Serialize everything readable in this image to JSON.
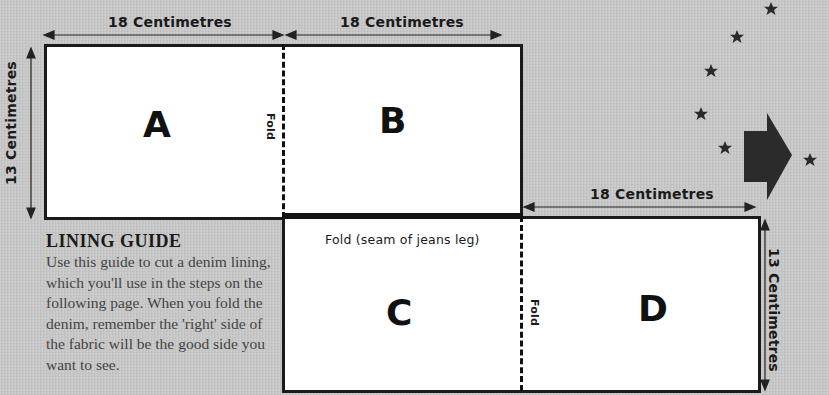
{
  "diagram": {
    "dimensions": {
      "top_left_width": "18 Centimetres",
      "top_right_width": "18 Centimetres",
      "left_height": "13 Centimetres",
      "bottom_right_width": "18 Centimetres",
      "right_height": "13 Centimetres"
    },
    "panels": [
      {
        "id": "A",
        "label": "A"
      },
      {
        "id": "B",
        "label": "B"
      },
      {
        "id": "C",
        "label": "C"
      },
      {
        "id": "D",
        "label": "D"
      }
    ],
    "fold_labels": {
      "top_fold": "Fold",
      "bottom_fold": "Fold",
      "seam_fold": "Fold (seam of jeans leg)"
    },
    "guide": {
      "title": "LINING GUIDE",
      "body": "Use this guide to cut a denim lining, which you'll use in the steps on the following page. When you fold the denim, remember the 'right' side of the fabric will be the good side you want to see."
    },
    "decorations": {
      "stars": 6,
      "arrow": "right-arrow",
      "colors": {
        "background": "#c9c9c9",
        "ink": "#1a1a1a",
        "panel": "#ffffff"
      }
    }
  }
}
